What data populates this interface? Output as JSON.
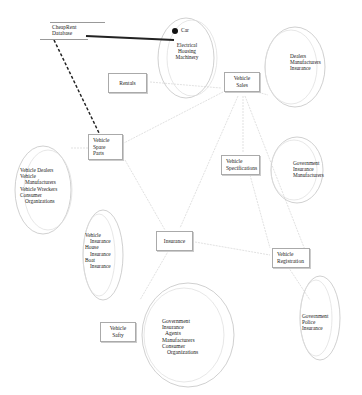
{
  "database": {
    "label_line1": "CheapRent",
    "label_line2": "Database"
  },
  "connector_label": "Car",
  "processes": {
    "rentals": "Rentals",
    "vehicle_sales": [
      "Vehicle",
      "Sales"
    ],
    "vehicle_spare_parts": [
      "Vehicle",
      "Spare",
      "Parts"
    ],
    "vehicle_specifications": [
      "Vehicle",
      "Specifications"
    ],
    "insurance": "Insurance",
    "vehicle_registration": [
      "Vehicle",
      "Registration"
    ],
    "vehicle_safety": [
      "Vehicle",
      "Safty"
    ]
  },
  "groups": {
    "top": [
      "Electrical",
      "Housing",
      "Machinery"
    ],
    "sales": [
      "Dealers",
      "Manufacturers",
      "Insurance"
    ],
    "spare_parts": [
      "Vehicle Dealers",
      "Vehicle",
      "Manufacturers",
      "Vehicle Wreckers",
      "Consumer",
      "Organizations"
    ],
    "specifications": [
      "Government",
      "Insurance",
      "Manufacturers"
    ],
    "insurance": [
      "Vehicle",
      "Insurance",
      "House",
      "Insurance",
      "Boat",
      "Insurance"
    ],
    "registration": [
      "Government",
      "Police",
      "Insurance"
    ],
    "safety": [
      "Government",
      "Insurance",
      "Agents",
      "Manufacturers",
      "Consumer",
      "Organizations"
    ]
  }
}
